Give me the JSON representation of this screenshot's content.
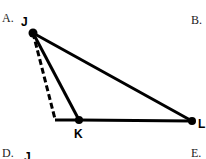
{
  "options": {
    "a": "A.",
    "b": "B.",
    "d": "D.",
    "e": "E."
  },
  "points": {
    "j": "J",
    "k": "K",
    "l": "L",
    "j_partial": "J"
  },
  "figure": {
    "vertices": {
      "J": [
        33,
        33
      ],
      "K": [
        79,
        120
      ],
      "L": [
        192,
        121
      ],
      "foot": [
        55,
        119
      ]
    }
  }
}
